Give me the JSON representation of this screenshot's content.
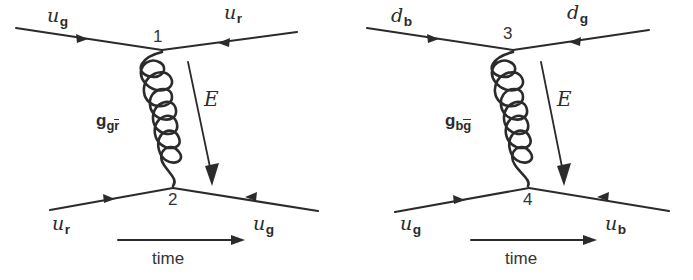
{
  "figure": {
    "background_color": "#ffffff",
    "stroke_color": "#2b2b2b",
    "type": "feynman-diagram-pair"
  },
  "diagrams": [
    {
      "id": "left",
      "incoming_top": "u",
      "incoming_top_sub": "g",
      "outgoing_top": "u",
      "outgoing_top_sub": "r",
      "incoming_bottom": "u",
      "incoming_bottom_sub": "r",
      "outgoing_bottom": "u",
      "outgoing_bottom_sub": "g",
      "vertex_top": "1",
      "vertex_bottom": "2",
      "gluon_symbol": "g",
      "gluon_sub_first": "g",
      "gluon_sub_second_bar": "r",
      "energy_label": "E",
      "time_label": "time"
    },
    {
      "id": "right",
      "incoming_top": "d",
      "incoming_top_sub": "b",
      "outgoing_top": "d",
      "outgoing_top_sub": "g",
      "incoming_bottom": "u",
      "incoming_bottom_sub": "g",
      "outgoing_bottom": "u",
      "outgoing_bottom_sub": "b",
      "vertex_top": "3",
      "vertex_bottom": "4",
      "gluon_symbol": "g",
      "gluon_sub_first": "b",
      "gluon_sub_second_bar": "g",
      "energy_label": "E",
      "time_label": "time"
    }
  ]
}
